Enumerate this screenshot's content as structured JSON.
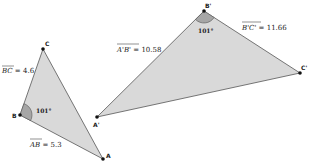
{
  "colors": {
    "fill": "#d9d9d9",
    "stroke": "#555555",
    "angle_fill": "#a6a6a6",
    "point": "#111111"
  },
  "triangle1": {
    "points": {
      "A": {
        "label": "A",
        "x": 103,
        "y": 159
      },
      "B": {
        "label": "B",
        "x": 20,
        "y": 115
      },
      "C": {
        "label": "C",
        "x": 43,
        "y": 49
      }
    },
    "segments": {
      "BC": {
        "name": "BC",
        "eq": " = 4.6"
      },
      "AB": {
        "name": "AB",
        "eq": " = 5.3"
      }
    },
    "angle": {
      "vertex": "B",
      "label": "101°"
    }
  },
  "triangle2": {
    "points": {
      "A": {
        "label": "A'",
        "x": 97,
        "y": 117
      },
      "B": {
        "label": "B'",
        "x": 204,
        "y": 11
      },
      "C": {
        "label": "C'",
        "x": 300,
        "y": 73
      }
    },
    "segments": {
      "AB": {
        "name": "A'B'",
        "eq": " = 10.58"
      },
      "BC": {
        "name": "B'C'",
        "eq": " = 11.66"
      }
    },
    "angle": {
      "vertex": "B'",
      "label": "101°"
    }
  }
}
